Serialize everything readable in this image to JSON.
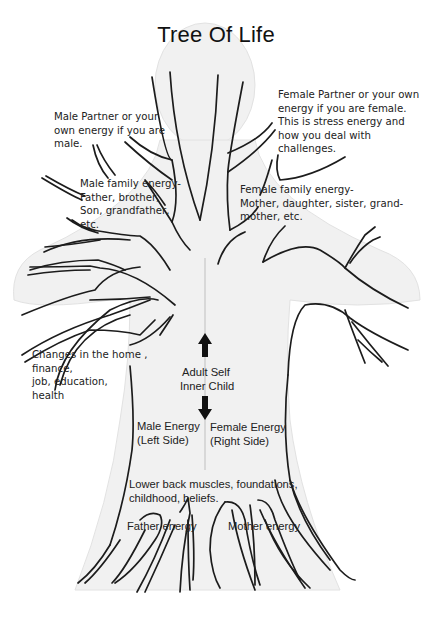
{
  "title": "Tree Of Life",
  "annotations": {
    "male_partner": {
      "lines": [
        "Male Partner or your",
        "own energy if you are",
        "male."
      ]
    },
    "female_partner": {
      "lines": [
        "Female Partner or your own",
        "energy if you are female.",
        "This is stress energy and",
        "how you deal with",
        "challenges."
      ]
    },
    "male_family": {
      "lines": [
        "Male family energy-",
        "Father, brother,",
        "Son, grandfather,",
        "etc."
      ]
    },
    "female_family": {
      "lines": [
        "Female family energy-",
        "Mother, daughter, sister, grand-",
        "mother, etc."
      ]
    },
    "changes": {
      "lines": [
        "Changes in the home ,",
        "finance,",
        "job, education,",
        "health"
      ]
    },
    "center": {
      "up_arrow": "arrow-up",
      "lines": [
        "Adult Self",
        "Inner Child"
      ],
      "down_arrow": "arrow-down"
    },
    "male_energy": {
      "lines": [
        "Male Energy",
        "(Left Side)"
      ]
    },
    "female_energy": {
      "lines": [
        "Female Energy",
        "(Right Side)"
      ]
    },
    "lower_back": {
      "lines": [
        "Lower back muscles, foundations,",
        "childhood, beliefs."
      ]
    },
    "father_energy": {
      "label": "Father energy"
    },
    "mother_energy": {
      "label": "Mother energy"
    }
  },
  "colors": {
    "line": "#1c1c1c",
    "body_shade": "#ececec",
    "background": "#ffffff"
  }
}
